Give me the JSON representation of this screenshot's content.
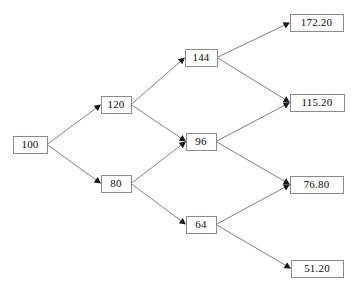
{
  "diagram": {
    "type": "binomial-tree",
    "background_color": "#ffffff",
    "box_fill_color": "#ffffff",
    "box_border_color": "#8a8a8a",
    "edge_color": "#808080",
    "arrowhead_color": "#1a1a1a",
    "text_color": "#0d0d0d"
  },
  "nodes": [
    {
      "id": "n0",
      "label": "100",
      "step": 0,
      "x": 13,
      "y": 136,
      "w": 34,
      "h": 17
    },
    {
      "id": "n1u",
      "label": "120",
      "step": 1,
      "x": 101,
      "y": 96,
      "w": 30,
      "h": 17
    },
    {
      "id": "n1d",
      "label": "80",
      "step": 1,
      "x": 101,
      "y": 175,
      "w": 30,
      "h": 17
    },
    {
      "id": "n2uu",
      "label": "144",
      "step": 2,
      "x": 185,
      "y": 49,
      "w": 32,
      "h": 17
    },
    {
      "id": "n2ud",
      "label": "96",
      "step": 2,
      "x": 186,
      "y": 133,
      "w": 30,
      "h": 17
    },
    {
      "id": "n2dd",
      "label": "64",
      "step": 2,
      "x": 186,
      "y": 216,
      "w": 30,
      "h": 17
    },
    {
      "id": "n3uuu",
      "label": "172.20",
      "step": 3,
      "x": 290,
      "y": 14,
      "w": 53,
      "h": 17
    },
    {
      "id": "n3uud",
      "label": "115.20",
      "step": 3,
      "x": 290,
      "y": 94,
      "w": 54,
      "h": 17
    },
    {
      "id": "n3udd",
      "label": "76.80",
      "step": 3,
      "x": 290,
      "y": 176,
      "w": 53,
      "h": 17
    },
    {
      "id": "n3ddd",
      "label": "51.20",
      "step": 3,
      "x": 291,
      "y": 260,
      "w": 52,
      "h": 17
    }
  ],
  "edges": [
    {
      "from": "n0",
      "to": "n1u",
      "direction": "up"
    },
    {
      "from": "n0",
      "to": "n1d",
      "direction": "down"
    },
    {
      "from": "n1u",
      "to": "n2uu",
      "direction": "up"
    },
    {
      "from": "n1u",
      "to": "n2ud",
      "direction": "down"
    },
    {
      "from": "n1d",
      "to": "n2ud",
      "direction": "up"
    },
    {
      "from": "n1d",
      "to": "n2dd",
      "direction": "down"
    },
    {
      "from": "n2uu",
      "to": "n3uuu",
      "direction": "up"
    },
    {
      "from": "n2uu",
      "to": "n3uud",
      "direction": "down"
    },
    {
      "from": "n2ud",
      "to": "n3uud",
      "direction": "up"
    },
    {
      "from": "n2ud",
      "to": "n3udd",
      "direction": "down"
    },
    {
      "from": "n2dd",
      "to": "n3udd",
      "direction": "up"
    },
    {
      "from": "n2dd",
      "to": "n3ddd",
      "direction": "down"
    }
  ]
}
